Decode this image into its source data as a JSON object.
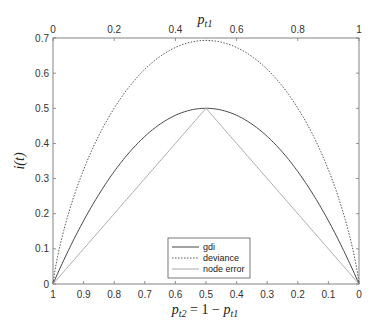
{
  "chart_data": {
    "type": "line",
    "title": "",
    "top_xlabel": "p_t1",
    "bottom_xlabel": "p_t2 = 1 − p_t1",
    "ylabel": "i(t)",
    "xlim": [
      0,
      1
    ],
    "ylim": [
      0,
      0.7
    ],
    "grid": false,
    "legend_position": "lower center (inside)",
    "top_xticks": [
      "0",
      "0.2",
      "0.4",
      "0.6",
      "0.8",
      "1"
    ],
    "top_xtick_values": [
      0,
      0.2,
      0.4,
      0.6,
      0.8,
      1
    ],
    "bottom_xticks": [
      "1",
      "0.9",
      "0.8",
      "0.7",
      "0.6",
      "0.5",
      "0.4",
      "0.3",
      "0.2",
      "0.1",
      "0"
    ],
    "yticks": [
      "0",
      "0.1",
      "0.2",
      "0.3",
      "0.4",
      "0.5",
      "0.6",
      "0.7"
    ],
    "x": [
      0,
      0.05,
      0.1,
      0.15,
      0.2,
      0.25,
      0.3,
      0.35,
      0.4,
      0.45,
      0.5,
      0.55,
      0.6,
      0.65,
      0.7,
      0.75,
      0.8,
      0.85,
      0.9,
      0.95,
      1
    ],
    "series": [
      {
        "name": "gdi",
        "style": "solid",
        "color": "#444444",
        "values": [
          0,
          0.095,
          0.18,
          0.255,
          0.32,
          0.375,
          0.42,
          0.455,
          0.48,
          0.495,
          0.5,
          0.495,
          0.48,
          0.455,
          0.42,
          0.375,
          0.32,
          0.255,
          0.18,
          0.095,
          0
        ]
      },
      {
        "name": "deviance",
        "style": "dotted",
        "color": "#555555",
        "values": [
          0,
          0.199,
          0.325,
          0.423,
          0.5,
          0.562,
          0.611,
          0.647,
          0.673,
          0.688,
          0.693,
          0.688,
          0.673,
          0.647,
          0.611,
          0.562,
          0.5,
          0.423,
          0.325,
          0.199,
          0
        ]
      },
      {
        "name": "node error",
        "style": "solid",
        "color": "#aaaaaa",
        "values": [
          0,
          0.05,
          0.1,
          0.15,
          0.2,
          0.25,
          0.3,
          0.35,
          0.4,
          0.45,
          0.5,
          0.45,
          0.4,
          0.35,
          0.3,
          0.25,
          0.2,
          0.15,
          0.1,
          0.05,
          0
        ]
      }
    ]
  },
  "labels": {
    "top_x_main": "p",
    "top_x_sub": "t1",
    "y_main": "i(t)",
    "bottom_x_p1": "p",
    "bottom_x_sub1": "t2",
    "bottom_x_mid": " = 1 − ",
    "bottom_x_p2": "p",
    "bottom_x_sub2": "t1"
  },
  "legend": {
    "items": [
      "gdi",
      "deviance",
      "node error"
    ]
  }
}
